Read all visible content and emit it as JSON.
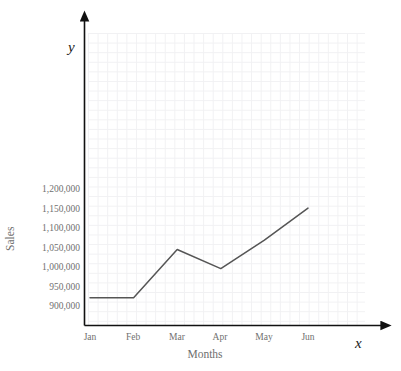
{
  "chart_data": {
    "type": "line",
    "title": "",
    "xlabel": "Months",
    "ylabel": "Sales",
    "categories": [
      "Jan",
      "Feb",
      "Mar",
      "Apr",
      "May",
      "Jun"
    ],
    "series": [
      {
        "name": "Sales",
        "values": [
          912000,
          912000,
          1036000,
          987000,
          1060000,
          1142000
        ],
        "color": "#555555"
      }
    ],
    "ylim": [
      880000,
      1230000
    ],
    "yticks": [
      900000,
      950000,
      1000000,
      1050000,
      1100000,
      1150000,
      1200000
    ],
    "ytick_labels": [
      "900,000",
      "950,000",
      "1,000,000",
      "1,050,000",
      "1,100,000",
      "1,150,000",
      "1,200,000"
    ],
    "grid": true,
    "legend": "none",
    "axis_letters": {
      "x": "x",
      "y": "y"
    },
    "axis_color": "#111111",
    "grid_color": "#f1f1f3",
    "tick_label_color": "#70706f"
  },
  "axes": {
    "x_letter": "x",
    "y_letter": "y",
    "x_title": "Months",
    "y_title": "Sales"
  },
  "xticks": [
    {
      "label": "Jan"
    },
    {
      "label": "Feb"
    },
    {
      "label": "Mar"
    },
    {
      "label": "Apr"
    },
    {
      "label": "May"
    },
    {
      "label": "Jun"
    }
  ],
  "yticks": [
    {
      "label": "1,200,000"
    },
    {
      "label": "1,150,000"
    },
    {
      "label": "1,100,000"
    },
    {
      "label": "1,050,000"
    },
    {
      "label": "1,000,000"
    },
    {
      "label": "950,000"
    },
    {
      "label": "900,000"
    }
  ]
}
